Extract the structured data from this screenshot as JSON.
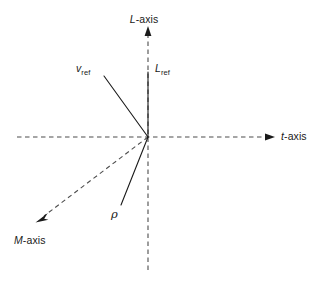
{
  "figure": {
    "type": "vector-axis-diagram",
    "background_color": "#ffffff",
    "stroke_color": "#1a1a1a",
    "dashed_color": "#4d4d4d",
    "origin": {
      "x": 148,
      "y": 137
    }
  },
  "axes": [
    {
      "id": "l-axis",
      "label_text": "L-axis",
      "label_italic_part": "L",
      "label_plain_part": "-axis",
      "style": "dashed",
      "direction": "up",
      "arrow": true,
      "from": {
        "x": 148,
        "y": 270
      },
      "to": {
        "x": 148,
        "y": 27
      }
    },
    {
      "id": "t-axis",
      "label_text": "t-axis",
      "label_italic_part": "t",
      "label_plain_part": "-axis",
      "style": "dashed",
      "direction": "right",
      "arrow": true,
      "from": {
        "x": 17,
        "y": 137
      },
      "to": {
        "x": 275,
        "y": 137
      }
    },
    {
      "id": "m-axis",
      "label_text": "M-axis",
      "label_italic_part": "M",
      "label_plain_part": "-axis",
      "style": "dashed",
      "direction": "down-left",
      "arrow": true,
      "from": {
        "x": 148,
        "y": 137
      },
      "to": {
        "x": 36,
        "y": 222
      }
    }
  ],
  "vectors": [
    {
      "id": "v-ref",
      "label_symbol": "v",
      "label_subscript": "ref",
      "style": "solid",
      "arrow": false,
      "from": {
        "x": 148,
        "y": 137
      },
      "to": {
        "x": 104,
        "y": 76
      }
    },
    {
      "id": "l-ref",
      "label_symbol": "L",
      "label_subscript": "ref",
      "style": "solid",
      "arrow": false,
      "from": {
        "x": 148,
        "y": 137
      },
      "to": {
        "x": 148,
        "y": 72
      }
    },
    {
      "id": "rho",
      "label_symbol": "ρ",
      "label_subscript": "",
      "style": "solid",
      "arrow": false,
      "from": {
        "x": 148,
        "y": 137
      },
      "to": {
        "x": 121,
        "y": 205
      }
    }
  ]
}
